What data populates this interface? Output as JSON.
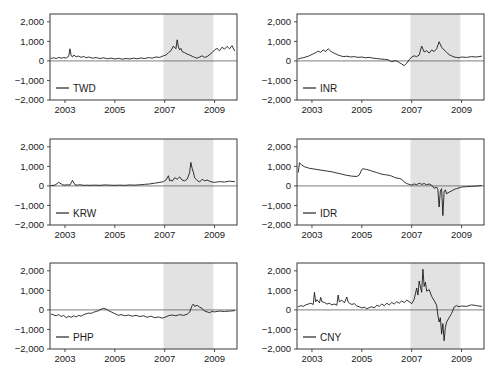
{
  "figure": {
    "background_color": "#ffffff",
    "shade_color": "#e2e2e2",
    "line_color": "#111111",
    "axis_color": "#3b3b3b",
    "panel_rows": 3,
    "panel_cols": 2
  },
  "chart_data": [
    {
      "type": "line",
      "title": "",
      "xlabel": "",
      "ylabel": "",
      "legend": "TWD",
      "legend_position": "bottom-left",
      "grid": false,
      "xlim": [
        2002.4,
        2009.9
      ],
      "ylim": [
        -2000,
        2400
      ],
      "yticks": [
        2000,
        1000,
        0,
        -1000,
        -2000
      ],
      "ytick_labels": [
        "2,000",
        "1,000",
        "0",
        "-1,000",
        "-2,000"
      ],
      "xticks": [
        2003,
        2005,
        2007,
        2009
      ],
      "xtick_labels": [
        "2003",
        "2005",
        "2007",
        "2009"
      ],
      "shaded_region": [
        2006.95,
        2008.95
      ],
      "zero_line": 0,
      "x": [
        2002.45,
        2002.55,
        2002.65,
        2002.75,
        2002.85,
        2002.95,
        2003.05,
        2003.15,
        2003.2,
        2003.25,
        2003.3,
        2003.35,
        2003.45,
        2003.55,
        2003.65,
        2003.75,
        2003.85,
        2003.95,
        2004.1,
        2004.25,
        2004.4,
        2004.55,
        2004.7,
        2004.85,
        2005.0,
        2005.15,
        2005.3,
        2005.45,
        2005.6,
        2005.75,
        2005.9,
        2006.05,
        2006.2,
        2006.35,
        2006.5,
        2006.65,
        2006.8,
        2006.95,
        2007.05,
        2007.15,
        2007.25,
        2007.35,
        2007.45,
        2007.5,
        2007.55,
        2007.6,
        2007.65,
        2007.7,
        2007.8,
        2007.9,
        2008.0,
        2008.1,
        2008.2,
        2008.3,
        2008.4,
        2008.5,
        2008.6,
        2008.7,
        2008.8,
        2008.9,
        2009.0,
        2009.1,
        2009.2,
        2009.3,
        2009.4,
        2009.5,
        2009.6,
        2009.7,
        2009.8
      ],
      "values": [
        130,
        160,
        120,
        180,
        140,
        170,
        150,
        230,
        620,
        260,
        200,
        300,
        210,
        250,
        180,
        230,
        160,
        200,
        140,
        170,
        120,
        160,
        110,
        140,
        100,
        130,
        90,
        120,
        100,
        140,
        110,
        150,
        120,
        170,
        140,
        200,
        180,
        260,
        300,
        420,
        520,
        760,
        620,
        1080,
        720,
        560,
        640,
        480,
        420,
        350,
        300,
        240,
        180,
        140,
        200,
        260,
        180,
        220,
        320,
        420,
        560,
        640,
        520,
        700,
        600,
        740,
        620,
        780,
        520
      ]
    },
    {
      "type": "line",
      "title": "",
      "xlabel": "",
      "ylabel": "",
      "legend": "INR",
      "legend_position": "bottom-left",
      "grid": false,
      "xlim": [
        2002.4,
        2009.9
      ],
      "ylim": [
        -2000,
        2400
      ],
      "yticks": [
        2000,
        1000,
        0,
        -1000,
        -2000
      ],
      "ytick_labels": [
        "2,000",
        "1,000",
        "0",
        "-1,000",
        "-2,000"
      ],
      "xticks": [
        2003,
        2005,
        2007,
        2009
      ],
      "xtick_labels": [
        "2003",
        "2005",
        "2007",
        "2009"
      ],
      "shaded_region": [
        2006.95,
        2008.95
      ],
      "zero_line": 0,
      "x": [
        2002.45,
        2002.55,
        2002.65,
        2002.75,
        2002.85,
        2002.95,
        2003.05,
        2003.15,
        2003.25,
        2003.35,
        2003.45,
        2003.55,
        2003.65,
        2003.75,
        2003.85,
        2003.95,
        2004.05,
        2004.15,
        2004.25,
        2004.4,
        2004.55,
        2004.7,
        2004.85,
        2005.0,
        2005.15,
        2005.3,
        2005.45,
        2005.6,
        2005.75,
        2005.9,
        2006.05,
        2006.2,
        2006.35,
        2006.5,
        2006.6,
        2006.7,
        2006.8,
        2006.9,
        2007.0,
        2007.1,
        2007.2,
        2007.3,
        2007.4,
        2007.5,
        2007.6,
        2007.7,
        2007.8,
        2007.9,
        2008.0,
        2008.1,
        2008.2,
        2008.3,
        2008.4,
        2008.5,
        2008.6,
        2008.7,
        2008.8,
        2008.9,
        2009.0,
        2009.2,
        2009.4,
        2009.6,
        2009.8
      ],
      "values": [
        100,
        140,
        160,
        200,
        240,
        300,
        360,
        420,
        500,
        440,
        560,
        480,
        620,
        500,
        420,
        360,
        300,
        260,
        220,
        240,
        200,
        220,
        180,
        200,
        160,
        180,
        140,
        120,
        100,
        80,
        60,
        -40,
        20,
        -80,
        -160,
        -240,
        -120,
        60,
        200,
        260,
        220,
        300,
        760,
        460,
        520,
        400,
        560,
        480,
        620,
        980,
        700,
        560,
        440,
        320,
        260,
        200,
        180,
        160,
        200,
        180,
        220,
        200,
        240
      ]
    },
    {
      "type": "line",
      "title": "",
      "xlabel": "",
      "ylabel": "",
      "legend": "KRW",
      "legend_position": "bottom-left",
      "grid": false,
      "xlim": [
        2002.4,
        2009.9
      ],
      "ylim": [
        -2000,
        2400
      ],
      "yticks": [
        2000,
        1000,
        0,
        -1000,
        -2000
      ],
      "ytick_labels": [
        "2,000",
        "1,000",
        "0",
        "-1,000",
        "-2,000"
      ],
      "xticks": [
        2003,
        2005,
        2007,
        2009
      ],
      "xtick_labels": [
        "2003",
        "2005",
        "2007",
        "2009"
      ],
      "shaded_region": [
        2006.95,
        2008.95
      ],
      "zero_line": 0,
      "x": [
        2002.45,
        2002.6,
        2002.75,
        2002.9,
        2003.0,
        2003.1,
        2003.2,
        2003.3,
        2003.4,
        2003.5,
        2003.6,
        2003.7,
        2003.8,
        2003.9,
        2004.0,
        2004.2,
        2004.4,
        2004.6,
        2004.8,
        2005.0,
        2005.2,
        2005.4,
        2005.6,
        2005.8,
        2006.0,
        2006.2,
        2006.4,
        2006.6,
        2006.8,
        2006.95,
        2007.05,
        2007.15,
        2007.2,
        2007.25,
        2007.3,
        2007.4,
        2007.5,
        2007.6,
        2007.7,
        2007.8,
        2007.9,
        2008.0,
        2008.05,
        2008.1,
        2008.15,
        2008.2,
        2008.3,
        2008.4,
        2008.5,
        2008.6,
        2008.7,
        2008.8,
        2008.9,
        2009.0,
        2009.2,
        2009.4,
        2009.6,
        2009.8
      ],
      "values": [
        20,
        40,
        180,
        60,
        40,
        60,
        40,
        280,
        60,
        40,
        60,
        40,
        30,
        40,
        30,
        40,
        30,
        50,
        40,
        30,
        40,
        30,
        50,
        40,
        60,
        80,
        100,
        140,
        180,
        220,
        300,
        520,
        260,
        300,
        240,
        420,
        340,
        460,
        300,
        260,
        340,
        680,
        1200,
        900,
        700,
        420,
        280,
        200,
        340,
        260,
        300,
        240,
        200,
        180,
        220,
        200,
        240,
        220
      ]
    },
    {
      "type": "line",
      "title": "",
      "xlabel": "",
      "ylabel": "",
      "legend": "IDR",
      "legend_position": "bottom-left",
      "grid": false,
      "xlim": [
        2002.4,
        2009.9
      ],
      "ylim": [
        -2000,
        2400
      ],
      "yticks": [
        2000,
        1000,
        0,
        -1000,
        -2000
      ],
      "ytick_labels": [
        "2,000",
        "1,000",
        "0",
        "-1,000",
        "-2,000"
      ],
      "xticks": [
        2003,
        2005,
        2007,
        2009
      ],
      "xtick_labels": [
        "2003",
        "2005",
        "2007",
        "2009"
      ],
      "shaded_region": [
        2006.95,
        2008.95
      ],
      "zero_line": 0,
      "x": [
        2002.45,
        2002.5,
        2002.6,
        2002.7,
        2002.8,
        2002.9,
        2003.0,
        2003.2,
        2003.4,
        2003.6,
        2003.8,
        2004.0,
        2004.2,
        2004.4,
        2004.6,
        2004.8,
        2004.9,
        2005.0,
        2005.05,
        2005.1,
        2005.2,
        2005.3,
        2005.4,
        2005.5,
        2005.6,
        2005.7,
        2005.8,
        2005.9,
        2006.0,
        2006.1,
        2006.2,
        2006.3,
        2006.4,
        2006.5,
        2006.6,
        2006.7,
        2006.8,
        2006.9,
        2007.0,
        2007.1,
        2007.2,
        2007.3,
        2007.4,
        2007.5,
        2007.6,
        2007.7,
        2007.8,
        2007.9,
        2008.0,
        2008.05,
        2008.1,
        2008.15,
        2008.2,
        2008.25,
        2008.3,
        2008.35,
        2008.4,
        2008.5,
        2008.6,
        2008.7,
        2008.8,
        2008.9,
        2009.0,
        2009.2,
        2009.4,
        2009.6,
        2009.8
      ],
      "values": [
        700,
        1180,
        1060,
        980,
        940,
        900,
        880,
        840,
        800,
        760,
        720,
        660,
        600,
        540,
        500,
        480,
        560,
        840,
        880,
        860,
        840,
        800,
        760,
        720,
        680,
        640,
        600,
        580,
        560,
        540,
        500,
        440,
        400,
        380,
        340,
        200,
        120,
        80,
        40,
        100,
        60,
        140,
        80,
        120,
        60,
        100,
        40,
        -120,
        -60,
        -180,
        -1080,
        -260,
        -140,
        -1520,
        -300,
        -200,
        -400,
        -320,
        -260,
        -180,
        -140,
        -100,
        -60,
        -40,
        -20,
        -10,
        20
      ]
    },
    {
      "type": "line",
      "title": "",
      "xlabel": "",
      "ylabel": "",
      "legend": "PHP",
      "legend_position": "bottom-left",
      "grid": false,
      "xlim": [
        2002.4,
        2009.9
      ],
      "ylim": [
        -2000,
        2400
      ],
      "yticks": [
        2000,
        1000,
        0,
        -1000,
        -2000
      ],
      "ytick_labels": [
        "2,000",
        "1,000",
        "0",
        "-1,000",
        "-2,000"
      ],
      "xticks": [
        2003,
        2005,
        2007,
        2009
      ],
      "xtick_labels": [
        "2003",
        "2005",
        "2007",
        "2009"
      ],
      "shaded_region": [
        2006.95,
        2008.95
      ],
      "zero_line": 0,
      "x": [
        2002.45,
        2002.55,
        2002.65,
        2002.75,
        2002.85,
        2002.95,
        2003.05,
        2003.15,
        2003.25,
        2003.35,
        2003.45,
        2003.55,
        2003.65,
        2003.75,
        2003.85,
        2003.95,
        2004.05,
        2004.15,
        2004.25,
        2004.35,
        2004.45,
        2004.55,
        2004.65,
        2004.75,
        2004.85,
        2004.95,
        2005.05,
        2005.15,
        2005.25,
        2005.4,
        2005.55,
        2005.7,
        2005.85,
        2006.0,
        2006.15,
        2006.3,
        2006.45,
        2006.6,
        2006.75,
        2006.9,
        2007.0,
        2007.15,
        2007.3,
        2007.45,
        2007.6,
        2007.75,
        2007.9,
        2008.0,
        2008.1,
        2008.15,
        2008.2,
        2008.3,
        2008.4,
        2008.5,
        2008.6,
        2008.7,
        2008.8,
        2008.9,
        2009.0,
        2009.2,
        2009.4,
        2009.6,
        2009.8
      ],
      "values": [
        -220,
        -260,
        -300,
        -240,
        -340,
        -280,
        -400,
        -320,
        -380,
        -300,
        -360,
        -280,
        -320,
        -240,
        -200,
        -160,
        -180,
        -120,
        -80,
        -40,
        40,
        80,
        40,
        -40,
        -100,
        -160,
        -220,
        -280,
        -240,
        -300,
        -260,
        -320,
        -280,
        -340,
        -300,
        -380,
        -320,
        -400,
        -360,
        -420,
        -380,
        -300,
        -260,
        -300,
        -240,
        -280,
        -220,
        -120,
        220,
        300,
        180,
        240,
        140,
        80,
        -60,
        -100,
        -140,
        -80,
        -100,
        -60,
        -80,
        -60,
        -40
      ]
    },
    {
      "type": "line",
      "title": "",
      "xlabel": "",
      "ylabel": "",
      "legend": "CNY",
      "legend_position": "bottom-left",
      "grid": false,
      "xlim": [
        2002.4,
        2009.9
      ],
      "ylim": [
        -2000,
        2400
      ],
      "yticks": [
        2000,
        1000,
        0,
        -1000,
        -2000
      ],
      "ytick_labels": [
        "2,000",
        "1,000",
        "0",
        "-1,000",
        "-2,000"
      ],
      "xticks": [
        2003,
        2005,
        2007,
        2009
      ],
      "xtick_labels": [
        "2003",
        "2005",
        "2007",
        "2009"
      ],
      "shaded_region": [
        2006.95,
        2008.95
      ],
      "zero_line": 0,
      "x": [
        2002.45,
        2002.55,
        2002.65,
        2002.75,
        2002.85,
        2002.95,
        2003.05,
        2003.1,
        2003.15,
        2003.2,
        2003.3,
        2003.35,
        2003.4,
        2003.5,
        2003.6,
        2003.7,
        2003.8,
        2003.9,
        2004.0,
        2004.05,
        2004.1,
        2004.2,
        2004.3,
        2004.4,
        2004.45,
        2004.5,
        2004.6,
        2004.7,
        2004.8,
        2004.9,
        2005.0,
        2005.1,
        2005.2,
        2005.3,
        2005.4,
        2005.5,
        2005.6,
        2005.7,
        2005.8,
        2005.9,
        2006.0,
        2006.1,
        2006.2,
        2006.3,
        2006.4,
        2006.5,
        2006.6,
        2006.7,
        2006.8,
        2006.9,
        2007.0,
        2007.1,
        2007.2,
        2007.25,
        2007.3,
        2007.4,
        2007.45,
        2007.5,
        2007.55,
        2007.6,
        2007.7,
        2007.8,
        2007.9,
        2008.0,
        2008.05,
        2008.1,
        2008.15,
        2008.2,
        2008.25,
        2008.3,
        2008.35,
        2008.4,
        2008.5,
        2008.6,
        2008.7,
        2008.8,
        2008.9,
        2009.0,
        2009.2,
        2009.4,
        2009.6,
        2009.8
      ],
      "values": [
        160,
        220,
        180,
        260,
        300,
        340,
        280,
        900,
        420,
        520,
        360,
        640,
        420,
        380,
        300,
        340,
        260,
        300,
        240,
        760,
        420,
        500,
        360,
        660,
        400,
        340,
        280,
        320,
        200,
        160,
        100,
        140,
        60,
        120,
        160,
        100,
        240,
        180,
        300,
        220,
        340,
        260,
        380,
        300,
        420,
        340,
        460,
        380,
        500,
        420,
        320,
        540,
        1120,
        760,
        1480,
        900,
        2080,
        1200,
        1420,
        960,
        1040,
        700,
        480,
        240,
        -260,
        -620,
        -400,
        -1240,
        -700,
        -1580,
        -900,
        -620,
        -400,
        -180,
        140,
        220,
        160,
        200,
        180,
        260,
        220,
        180
      ]
    }
  ]
}
